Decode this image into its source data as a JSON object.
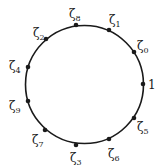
{
  "diagram": {
    "type": "unit-circle-roots",
    "circle": {
      "cx": 84.5,
      "cy": 84.5,
      "r": 59,
      "stroke": "#1a1a1a",
      "stroke_width": 1.6
    },
    "points": [
      {
        "id": "one",
        "symbol": "1",
        "sub": "",
        "x": 143,
        "y": 84,
        "lx": 148,
        "ly": 89
      },
      {
        "id": "z0",
        "symbol": "ζ",
        "sub": "0",
        "x": 134,
        "y": 52,
        "lx": 137,
        "ly": 50
      },
      {
        "id": "z1",
        "symbol": "ζ",
        "sub": "1",
        "x": 109,
        "y": 30,
        "lx": 109,
        "ly": 24
      },
      {
        "id": "z8",
        "symbol": "ζ",
        "sub": "8",
        "x": 76,
        "y": 25,
        "lx": 69,
        "ly": 18
      },
      {
        "id": "z2",
        "symbol": "ζ",
        "sub": "2",
        "x": 46,
        "y": 39,
        "lx": 33,
        "ly": 37
      },
      {
        "id": "z4",
        "symbol": "ζ",
        "sub": "4",
        "x": 28,
        "y": 67,
        "lx": 9,
        "ly": 70
      },
      {
        "id": "z9",
        "symbol": "ζ",
        "sub": "9",
        "x": 28,
        "y": 101,
        "lx": 9,
        "ly": 110
      },
      {
        "id": "z7",
        "symbol": "ζ",
        "sub": "7",
        "x": 45,
        "y": 130,
        "lx": 32,
        "ly": 144
      },
      {
        "id": "z3",
        "symbol": "ζ",
        "sub": "3",
        "x": 76,
        "y": 145,
        "lx": 70,
        "ly": 162
      },
      {
        "id": "z6",
        "symbol": "ζ",
        "sub": "6",
        "x": 109,
        "y": 139,
        "lx": 108,
        "ly": 158
      },
      {
        "id": "z5",
        "symbol": "ζ",
        "sub": "5",
        "x": 134,
        "y": 118,
        "lx": 137,
        "ly": 131
      }
    ],
    "point_color": "#1a1a1a",
    "point_radius": 2.3
  }
}
